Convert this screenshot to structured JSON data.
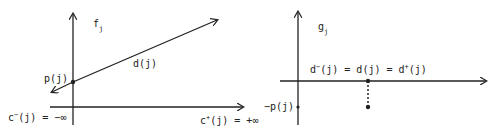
{
  "left_panel": {
    "axis_label": "f",
    "axis_label_sub": "j",
    "line_label": "d(j)",
    "intercept_label": "p(j)",
    "x_left_label_pre": "c",
    "x_left_label_sup": "−",
    "x_left_label_post": "(j) = −∞",
    "x_right_label_pre": "c",
    "x_right_label_sup": "+",
    "x_right_label_post": "(j) = +∞"
  },
  "right_panel": {
    "axis_label": "g",
    "axis_label_sub": "j",
    "point_label_a_pre": "d",
    "point_label_a_sup": "−",
    "point_label_mid": "(j) = d(j) = d",
    "point_label_b_sup": "+",
    "point_label_end": "(j)",
    "y_point_label": "−p(j)"
  },
  "colors": {
    "ink": "#222222",
    "background": "#ffffff"
  }
}
